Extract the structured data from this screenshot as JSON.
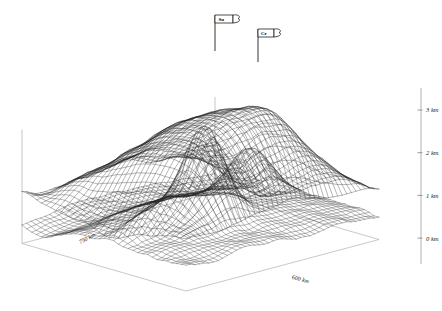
{
  "figure": {
    "kind": "3d-wireframe-surface-plot",
    "background_color": "#ffffff",
    "mesh_color": "#1a1a1a",
    "axis_color": "#9a9a9a",
    "box_color": "#b4b4b4"
  },
  "chart_data": {
    "type": "line",
    "title": "",
    "subtitle": "",
    "xlabel": "600 km",
    "ylabel": "750 km",
    "zlabel": "km",
    "grid": true,
    "legend_position": "none",
    "projection": "3d-mesh",
    "surfaces": [
      {
        "name": "upper-surface",
        "description": "upper wireframe surface (topography / upper interface)"
      },
      {
        "name": "lower-surface",
        "description": "lower wireframe surface (basement / lower interface)"
      }
    ],
    "z_axis": {
      "label": "elevation",
      "unit": "km",
      "ticks": [
        {
          "value": 3,
          "label": "3 km"
        },
        {
          "value": 2,
          "label": "2 km"
        },
        {
          "value": 1,
          "label": "1 km"
        },
        {
          "value": 0,
          "label": "0 km"
        }
      ],
      "zlim": [
        0,
        3
      ]
    },
    "x_axis": {
      "label": "600 km",
      "extent_km": 600
    },
    "y_axis": {
      "label": "750 km",
      "extent_km": 750
    },
    "annotations": [
      {
        "name": "flag-su",
        "label": "Su",
        "kind": "flag-marker"
      },
      {
        "name": "flag-cr",
        "label": "Cr",
        "kind": "flag-marker"
      }
    ]
  },
  "axes": {
    "z_ticks": [
      {
        "label": "3 km"
      },
      {
        "label": "2 km"
      },
      {
        "label": "1 km"
      },
      {
        "label": "0 km"
      }
    ],
    "x_label": "600 km",
    "y_label": "750 km"
  },
  "flags": [
    {
      "label": "Su"
    },
    {
      "label": "Cr"
    }
  ]
}
